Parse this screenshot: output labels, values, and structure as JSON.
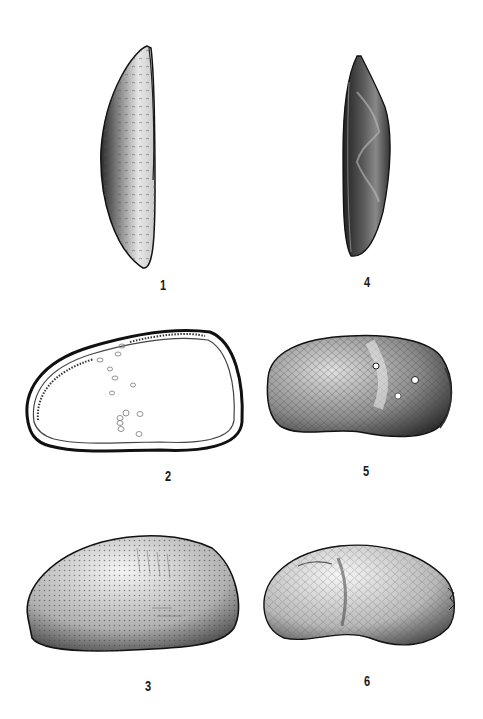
{
  "plate": {
    "background": "#ffffff",
    "ink": "#1a1a1a",
    "figures": [
      {
        "number": "1",
        "view": "dorsal view, elongate carapace with pitted surface"
      },
      {
        "number": "2",
        "view": "interior view of valve, showing marginal zone and muscle scars"
      },
      {
        "number": "3",
        "view": "lateral view, punctate surface"
      },
      {
        "number": "4",
        "view": "dorsal view, lobate carapace"
      },
      {
        "number": "5",
        "view": "lateral view, reticulate surface with sulcus and nodes"
      },
      {
        "number": "6",
        "view": "lateral view, reticulate surface with lobes"
      }
    ]
  }
}
